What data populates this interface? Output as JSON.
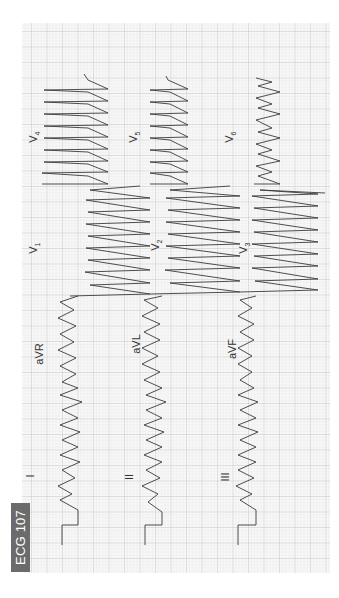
{
  "figure": {
    "label": "ECG 107",
    "orientation": "rotated 90° counter-clockwise (time axis runs bottom-to-top)",
    "colors": {
      "grid_minor": "#d9d9d9",
      "grid_major": "#bdbdbd",
      "trace": "#3a3a3a",
      "badge_bg": "#6b6b6b",
      "badge_text": "#ffffff",
      "paper": "#f7f7f7"
    }
  },
  "leads": {
    "I": {
      "label": "I"
    },
    "II": {
      "label": "II"
    },
    "III": {
      "label": "III"
    },
    "aVR": {
      "label": "aVR"
    },
    "aVL": {
      "label": "aVL"
    },
    "aVF": {
      "label": "aVF"
    },
    "V1": {
      "label": "V",
      "sub": "1"
    },
    "V2": {
      "label": "V",
      "sub": "2"
    },
    "V3": {
      "label": "V",
      "sub": "3"
    },
    "V4": {
      "label": "V",
      "sub": "4"
    },
    "V5": {
      "label": "V",
      "sub": "5"
    },
    "V6": {
      "label": "V",
      "sub": "6"
    }
  }
}
